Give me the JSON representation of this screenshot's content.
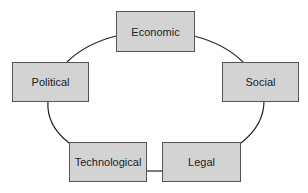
{
  "diagram": {
    "type": "cycle",
    "nodes": [
      {
        "id": "economic",
        "label": "Economic"
      },
      {
        "id": "social",
        "label": "Social"
      },
      {
        "id": "legal",
        "label": "Legal"
      },
      {
        "id": "technological",
        "label": "Technological"
      },
      {
        "id": "political",
        "label": "Political"
      }
    ],
    "edges": [
      [
        "economic",
        "social"
      ],
      [
        "social",
        "legal"
      ],
      [
        "legal",
        "technological"
      ],
      [
        "technological",
        "political"
      ],
      [
        "political",
        "economic"
      ]
    ]
  },
  "colors": {
    "box_fill": "#d3d3d3",
    "box_border": "#555555",
    "line": "#222222"
  }
}
